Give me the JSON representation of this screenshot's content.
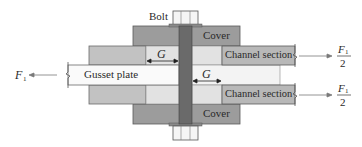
{
  "diagram": {
    "labels": {
      "bolt": "Bolt",
      "cover_top": "Cover",
      "cover_bottom": "Cover",
      "gusset_plate": "Gusset plate",
      "channel_top": "Channel section",
      "channel_bottom": "Channel section",
      "grip_left": "G",
      "grip_right": "G",
      "force_left_symbol": "F",
      "force_left_subscript": "1",
      "force_right_top_num_symbol": "F",
      "force_right_top_num_subscript": "1",
      "force_right_top_den": "2",
      "force_right_bottom_num_symbol": "F",
      "force_right_bottom_num_subscript": "1",
      "force_right_bottom_den": "2"
    },
    "colors": {
      "cover": "#9c9c9c",
      "filler": "#c2c2c2",
      "channel": "#b8b8b8",
      "light_fill": "#e2e2e2",
      "gusset": "#fafafa",
      "bolt_shaft": "#6a6a6a",
      "outline": "#555555",
      "arrow": "#7a7a7a"
    }
  }
}
